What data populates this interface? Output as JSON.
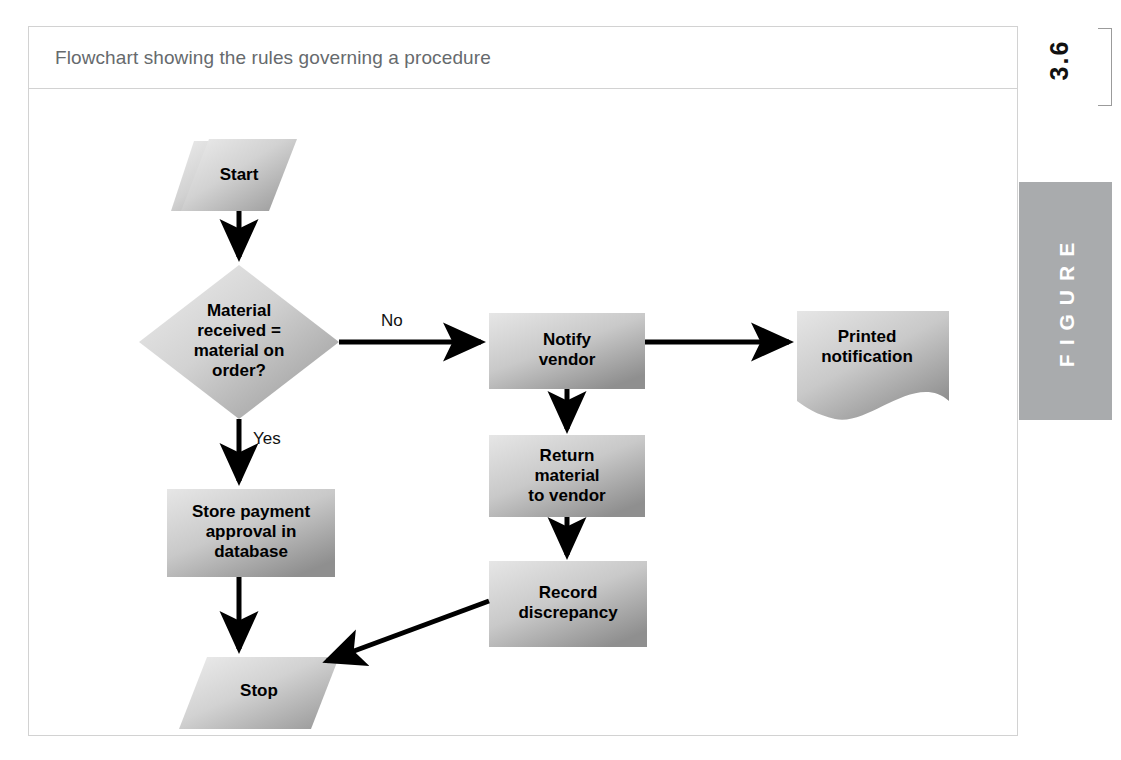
{
  "figure": {
    "caption": "Flowchart showing the rules governing a procedure",
    "number": "3.6",
    "tab_label": "FIGURE"
  },
  "flowchart": {
    "nodes": [
      {
        "id": "start",
        "label": "Start",
        "shape": "parallelogram"
      },
      {
        "id": "decision",
        "label": "Material\nreceived =\nmaterial on\norder?",
        "shape": "diamond"
      },
      {
        "id": "notify",
        "label": "Notify\nvendor",
        "shape": "process"
      },
      {
        "id": "printed",
        "label": "Printed\nnotification",
        "shape": "document"
      },
      {
        "id": "return",
        "label": "Return\nmaterial\nto vendor",
        "shape": "process"
      },
      {
        "id": "record",
        "label": "Record\ndiscrepancy",
        "shape": "process"
      },
      {
        "id": "store",
        "label": "Store payment\napproval in\ndatabase",
        "shape": "process"
      },
      {
        "id": "stop",
        "label": "Stop",
        "shape": "parallelogram"
      }
    ],
    "edges": [
      {
        "from": "start",
        "to": "decision",
        "label": ""
      },
      {
        "from": "decision",
        "to": "notify",
        "label": "No"
      },
      {
        "from": "decision",
        "to": "store",
        "label": "Yes"
      },
      {
        "from": "notify",
        "to": "printed",
        "label": ""
      },
      {
        "from": "notify",
        "to": "return",
        "label": ""
      },
      {
        "from": "return",
        "to": "record",
        "label": ""
      },
      {
        "from": "record",
        "to": "stop",
        "label": ""
      },
      {
        "from": "store",
        "to": "stop",
        "label": ""
      }
    ],
    "colors": {
      "shape_light": "#e8e8e8",
      "shape_dark": "#9a9a9a",
      "arrow": "#000000",
      "caption_text": "#666a6d",
      "frame_border": "#d2d2d2",
      "tab_background": "#a9abad"
    }
  }
}
